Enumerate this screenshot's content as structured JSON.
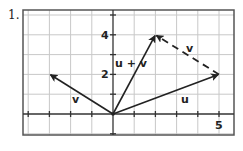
{
  "problem": {
    "number": "1."
  },
  "axes": {
    "x_tick_label": "5",
    "y_tick_labels": [
      "2",
      "4"
    ],
    "x_range": [
      -4,
      5
    ],
    "y_range": [
      -1,
      5
    ]
  },
  "vectors": [
    {
      "name": "u",
      "label": "u",
      "from": [
        0,
        0
      ],
      "to": [
        5,
        2
      ],
      "style": "solid"
    },
    {
      "name": "v",
      "label": "v",
      "from": [
        0,
        0
      ],
      "to": [
        -3,
        2
      ],
      "style": "solid"
    },
    {
      "name": "u_plus_v",
      "label": "u + v",
      "from": [
        0,
        0
      ],
      "to": [
        2,
        4
      ],
      "style": "solid"
    },
    {
      "name": "v_translated",
      "label": "v",
      "from": [
        5,
        2
      ],
      "to": [
        2,
        4
      ],
      "style": "dashed"
    }
  ],
  "colors": {
    "ink": "#222222",
    "grid": "#c8c8c8",
    "frame": "#555555"
  }
}
